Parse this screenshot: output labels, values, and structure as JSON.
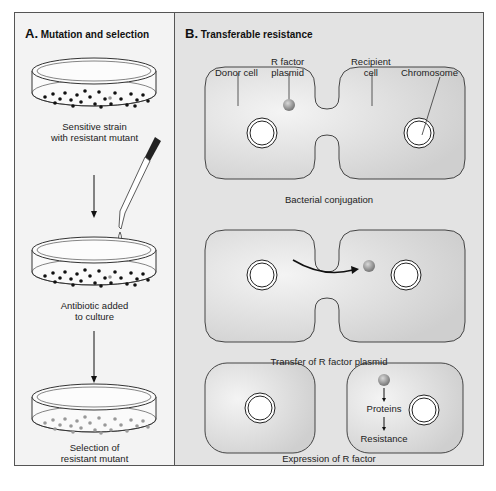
{
  "panel_a": {
    "letter": "A.",
    "title": "Mutation and selection",
    "steps": [
      {
        "label_line1": "Sensitive strain",
        "label_line2": "with resistant mutant"
      },
      {
        "label_line1": "Antibiotic added",
        "label_line2": "to culture"
      },
      {
        "label_line1": "Selection of",
        "label_line2": "resistant mutant"
      }
    ]
  },
  "panel_b": {
    "letter": "B.",
    "title": "Transferable resistance",
    "callouts": {
      "donor_cell": "Donor cell",
      "r_factor_line1": "R factor",
      "r_factor_line2": "plasmid",
      "recipient_line1": "Recipient",
      "recipient_line2": "cell",
      "chromosome": "Chromosome"
    },
    "stages": [
      {
        "caption": "Bacterial conjugation"
      },
      {
        "caption": "Transfer of R factor plasmid"
      },
      {
        "caption": "Expression of R factor",
        "steps": [
          "Proteins",
          "Resistance"
        ]
      }
    ]
  },
  "colors": {
    "cell_fill": "#d6d6d6",
    "plasmid": "#9a9a9a",
    "panel_a_bg": "#f3f3f3",
    "panel_b_bg": "#e3e3e3"
  }
}
